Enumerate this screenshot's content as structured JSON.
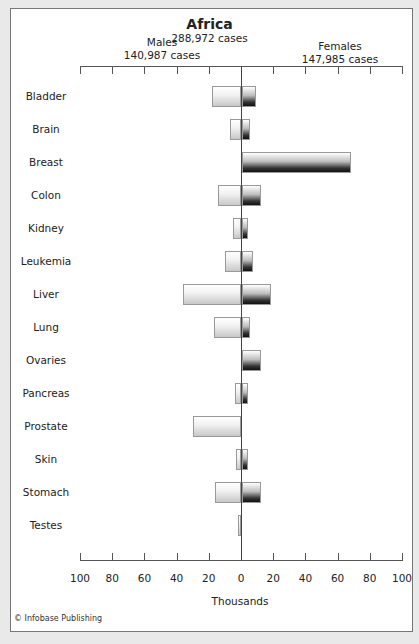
{
  "chart_data": {
    "type": "bar",
    "orientation": "horizontal-butterfly",
    "title": "Africa",
    "subtitle": "288,972 cases",
    "xlabel": "Thousands",
    "xlim": [
      -100,
      100
    ],
    "x_ticks": [
      100,
      80,
      60,
      40,
      20,
      0,
      20,
      40,
      60,
      80,
      100
    ],
    "categories": [
      "Bladder",
      "Brain",
      "Breast",
      "Colon",
      "Kidney",
      "Leukemia",
      "Liver",
      "Lung",
      "Ovaries",
      "Pancreas",
      "Prostate",
      "Skin",
      "Stomach",
      "Testes"
    ],
    "series": [
      {
        "name": "Males",
        "total_label": "140,987 cases",
        "values": [
          18,
          7,
          0,
          14,
          5,
          10,
          36,
          17,
          0,
          4,
          30,
          3,
          16,
          2
        ]
      },
      {
        "name": "Females",
        "total_label": "147,985 cases",
        "values": [
          9,
          5,
          68,
          12,
          4,
          7,
          18,
          5,
          12,
          4,
          0,
          4,
          12,
          0
        ]
      }
    ],
    "credit": "© Infobase Publishing"
  },
  "header": {
    "title": "Africa",
    "subtitle": "288,972 cases",
    "males_label": "Males",
    "males_cases": "140,987 cases",
    "females_label": "Females",
    "females_cases": "147,985 cases"
  },
  "axis": {
    "ticks": [
      "100",
      "80",
      "60",
      "40",
      "20",
      "0",
      "20",
      "40",
      "60",
      "80",
      "100"
    ],
    "label": "Thousands"
  },
  "credit": "© Infobase Publishing"
}
